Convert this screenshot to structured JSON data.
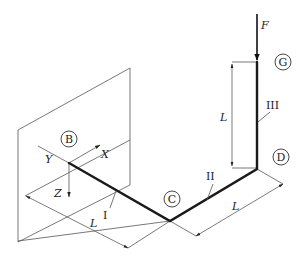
{
  "diagram": {
    "points": {
      "B": "B",
      "C": "C",
      "D": "D",
      "G": "G"
    },
    "segments": {
      "I": "I",
      "II": "II",
      "III": "III"
    },
    "axes": {
      "x": "X",
      "y": "Y",
      "z": "Z"
    },
    "load": "F",
    "dimensions": {
      "bc": "L",
      "cd": "L",
      "dg": "L"
    },
    "colors": {
      "bar": "#1a1a1a",
      "lines": "#555555"
    }
  }
}
